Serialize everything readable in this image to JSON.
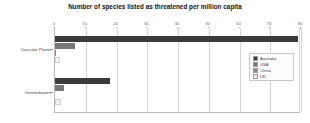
{
  "chart_data": {
    "type": "bar",
    "orientation": "horizontal",
    "title": "Number of species listed as threatened per million capita",
    "xlabel": "",
    "ylabel": "",
    "categories": [
      "Vascular Plants",
      "Invertebrates"
    ],
    "series": [
      {
        "name": "Australia",
        "color": "#3b3b3b",
        "values": [
          79.0,
          18.0
        ]
      },
      {
        "name": "USA",
        "color": "#777777",
        "values": [
          6.5,
          3.0
        ]
      },
      {
        "name": "China",
        "color": "#8c8c8c",
        "values": [
          0.4,
          0.0
        ]
      },
      {
        "name": "UK",
        "color": "#f1f1f1",
        "values": [
          0.0,
          2.0
        ]
      }
    ],
    "xlim": [
      0,
      80
    ],
    "xticks": [
      0,
      10,
      20,
      30,
      40,
      50,
      60,
      70,
      80
    ],
    "xtick_labels": [
      "0",
      "10",
      "20",
      "30",
      "40",
      "50",
      "60",
      "70",
      "80"
    ],
    "grid": true,
    "grid_axis": "x",
    "legend_position": "center right",
    "legend_entries": [
      "Australia",
      "USA",
      "China",
      "UK"
    ],
    "background_color": "#ffffff",
    "axis_color": "#b9b9b9",
    "grid_color": "#d5d5d5"
  }
}
